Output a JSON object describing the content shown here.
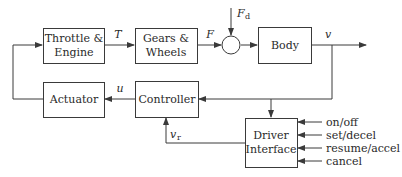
{
  "diagram": {
    "blocks": {
      "throttle": {
        "line1": "Throttle &",
        "line2": "Engine"
      },
      "gears": {
        "line1": "Gears &",
        "line2": "Wheels"
      },
      "body": {
        "label": "Body"
      },
      "actuator": {
        "label": "Actuator"
      },
      "controller": {
        "label": "Controller"
      },
      "driver": {
        "line1": "Driver",
        "line2": "Interface"
      }
    },
    "signals": {
      "torque": "T",
      "force": "F",
      "disturbance": "F",
      "disturbance_sub": "d",
      "velocity": "v",
      "control": "u",
      "reference": "v",
      "reference_sub": "r"
    },
    "driver_inputs": [
      "on/off",
      "set/decel",
      "resume/accel",
      "cancel"
    ],
    "colors": {
      "stroke": "#3a3a3a",
      "text": "#2a2a2a",
      "background": "#ffffff"
    }
  }
}
